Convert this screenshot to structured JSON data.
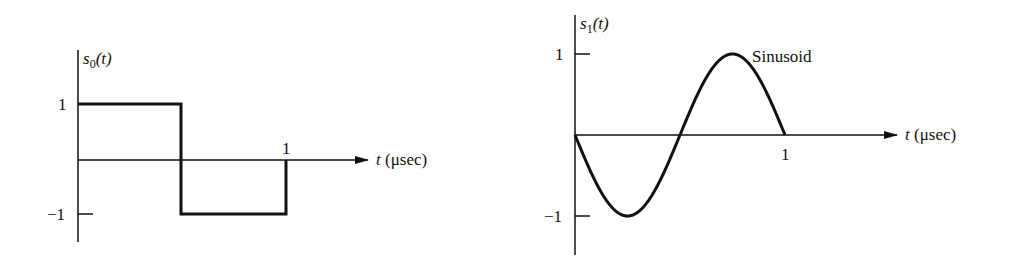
{
  "chart_data": [
    {
      "type": "line",
      "name": "s0",
      "ylabel_fn": "s",
      "ylabel_sub": "0",
      "ylabel_arg": "(t)",
      "xlabel_var": "t",
      "xlabel_unit": "(μsec)",
      "x": [
        0,
        0.5,
        0.5,
        1
      ],
      "y": [
        1,
        1,
        -1,
        -1
      ],
      "xticks": [
        "1"
      ],
      "yticks": [
        "1",
        "−1"
      ],
      "xlim": [
        0,
        1
      ],
      "ylim": [
        -1,
        1
      ],
      "grid": false,
      "legend": "none",
      "description": "Square wave: +1 for 0<t<0.5, −1 for 0.5<t<1"
    },
    {
      "type": "line",
      "name": "s1",
      "ylabel_fn": "s",
      "ylabel_sub": "1",
      "ylabel_arg": "(t)",
      "xlabel_var": "t",
      "xlabel_unit": "(μsec)",
      "annotation": "Sinusoid",
      "x": [
        0,
        0.25,
        0.5,
        0.75,
        1
      ],
      "y": [
        0,
        -1,
        0,
        1,
        0
      ],
      "xticks": [
        "1"
      ],
      "yticks": [
        "1",
        "−1"
      ],
      "xlim": [
        0,
        1
      ],
      "ylim": [
        -1,
        1
      ],
      "grid": false,
      "legend": "none",
      "description": "One period of −sin(2πt), t in μsec"
    }
  ]
}
